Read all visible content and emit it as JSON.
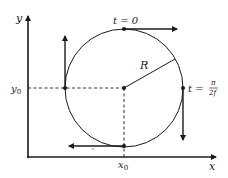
{
  "diagram": {
    "axes": {
      "x_label": "x",
      "y_label": "y",
      "x0_label": "x",
      "x0_sub": "0",
      "y0_label": "y",
      "y0_sub": "0"
    },
    "circle": {
      "radius_label": "R",
      "center": "(x0, y0)"
    },
    "annotations": {
      "top_time": "t = 0",
      "right_time_prefix": "t =",
      "right_time_num": "π",
      "right_time_den": "2f"
    },
    "points": [
      {
        "name": "top",
        "velocity_direction": "right"
      },
      {
        "name": "right",
        "velocity_direction": "down"
      },
      {
        "name": "bottom",
        "velocity_direction": "left"
      },
      {
        "name": "left",
        "velocity_direction": "up"
      },
      {
        "name": "center",
        "velocity_direction": "none"
      }
    ],
    "colors": {
      "ink": "#1a1a1a",
      "background": "#ffffff"
    }
  }
}
